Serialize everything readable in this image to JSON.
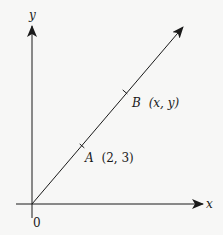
{
  "diagram": {
    "type": "coordinate-plane",
    "axes": {
      "x_label": "x",
      "y_label": "y",
      "origin_label": "0"
    },
    "line": {
      "description": "ray from origin through A and B",
      "from": "origin"
    },
    "points": [
      {
        "name": "A",
        "coords": "(2, 3)",
        "label_name": "A",
        "label_coords": "(2, 3)"
      },
      {
        "name": "B",
        "coords": "(x, y)",
        "label_name": "B",
        "label_coords": "(x, y)"
      }
    ],
    "colors": {
      "ink": "#1a1a1a",
      "background": "#f7f7f6"
    }
  }
}
